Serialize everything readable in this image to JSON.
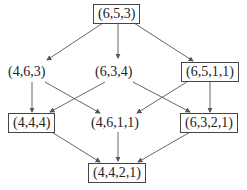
{
  "diagram": {
    "nodes": [
      {
        "id": "n653",
        "label": "(6,5,3)",
        "boxed": true
      },
      {
        "id": "n463",
        "label": "(4,6,3)",
        "boxed": false
      },
      {
        "id": "n634",
        "label": "(6,3,4)",
        "boxed": false
      },
      {
        "id": "n6511",
        "label": "(6,5,1,1)",
        "boxed": true
      },
      {
        "id": "n444",
        "label": "(4,4,4)",
        "boxed": true
      },
      {
        "id": "n4611",
        "label": "(4,6,1,1)",
        "boxed": false
      },
      {
        "id": "n6321",
        "label": "(6,3,2,1)",
        "boxed": true
      },
      {
        "id": "n4421",
        "label": "(4,4,2,1)",
        "boxed": true
      }
    ],
    "edges": [
      [
        "(6,5,3)",
        "(4,6,3)"
      ],
      [
        "(6,5,3)",
        "(6,3,4)"
      ],
      [
        "(6,5,3)",
        "(6,5,1,1)"
      ],
      [
        "(4,6,3)",
        "(4,4,4)"
      ],
      [
        "(4,6,3)",
        "(4,6,1,1)"
      ],
      [
        "(6,3,4)",
        "(4,4,4)"
      ],
      [
        "(6,3,4)",
        "(6,3,2,1)"
      ],
      [
        "(6,5,1,1)",
        "(4,6,1,1)"
      ],
      [
        "(6,5,1,1)",
        "(6,3,2,1)"
      ],
      [
        "(4,4,4)",
        "(4,4,2,1)"
      ],
      [
        "(4,6,1,1)",
        "(4,4,2,1)"
      ],
      [
        "(6,3,2,1)",
        "(4,4,2,1)"
      ]
    ],
    "colors": {
      "line": "#555555",
      "text": "#222222"
    }
  }
}
